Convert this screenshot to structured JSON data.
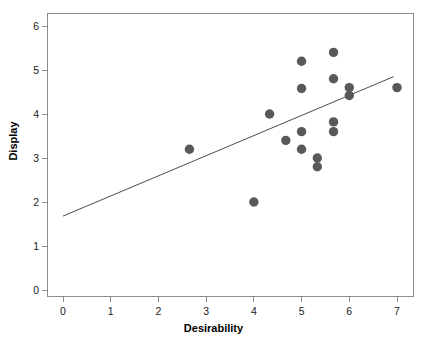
{
  "chart_data": {
    "type": "scatter",
    "title": "",
    "xlabel": "Desirability",
    "ylabel": "Display",
    "xlim": [
      -0.35,
      7.35
    ],
    "ylim": [
      -0.38,
      6.35
    ],
    "xticks": [
      0,
      1,
      2,
      3,
      4,
      5,
      6,
      7
    ],
    "yticks": [
      0,
      1,
      2,
      3,
      4,
      5,
      6
    ],
    "xtick_labels": [
      "0",
      "1",
      "2",
      "3",
      "4",
      "5",
      "6",
      "7"
    ],
    "ytick_labels": [
      "0",
      "1",
      "2",
      "3",
      "4",
      "5",
      "6"
    ],
    "grid": false,
    "legend": null,
    "marker_color": "#595959",
    "marker_size": 7,
    "line_color": "#4d4d4d",
    "points": [
      {
        "x": 2.65,
        "y": 3.2
      },
      {
        "x": 4.0,
        "y": 2.0
      },
      {
        "x": 4.33,
        "y": 4.0
      },
      {
        "x": 4.67,
        "y": 3.4
      },
      {
        "x": 5.0,
        "y": 5.2
      },
      {
        "x": 5.0,
        "y": 4.58
      },
      {
        "x": 5.0,
        "y": 3.6
      },
      {
        "x": 5.0,
        "y": 3.2
      },
      {
        "x": 5.33,
        "y": 3.0
      },
      {
        "x": 5.33,
        "y": 2.8
      },
      {
        "x": 5.67,
        "y": 5.4
      },
      {
        "x": 5.67,
        "y": 4.8
      },
      {
        "x": 5.67,
        "y": 3.82
      },
      {
        "x": 5.67,
        "y": 3.6
      },
      {
        "x": 6.0,
        "y": 4.6
      },
      {
        "x": 6.0,
        "y": 4.42
      },
      {
        "x": 7.0,
        "y": 4.6
      }
    ],
    "series": [
      {
        "name": "observations",
        "x": [
          2.65,
          4.0,
          4.33,
          4.67,
          5.0,
          5.0,
          5.0,
          5.0,
          5.33,
          5.33,
          5.67,
          5.67,
          5.67,
          5.67,
          6.0,
          6.0,
          7.0
        ],
        "values": [
          3.2,
          2.0,
          4.0,
          3.4,
          5.2,
          4.58,
          3.6,
          3.2,
          3.0,
          2.8,
          5.4,
          4.8,
          3.82,
          3.6,
          4.6,
          4.42,
          4.6
        ]
      }
    ],
    "trendline": {
      "type": "linear-fit",
      "x_start": 0.0,
      "y_start": 1.68,
      "x_end": 6.93,
      "y_end": 4.85,
      "slope": 0.4574,
      "intercept": 1.68
    }
  }
}
